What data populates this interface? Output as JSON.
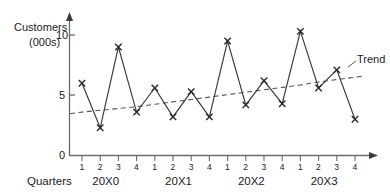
{
  "chart_data": {
    "type": "line",
    "title": "",
    "ylabel": "Customers (000s)",
    "xlabel": "Quarters",
    "ylim": [
      0,
      11
    ],
    "yticks": [
      0,
      5,
      10
    ],
    "ytick_labels": [
      "0",
      "5",
      "10"
    ],
    "grid": false,
    "legend_position": "inline-right",
    "categories": [
      "1",
      "2",
      "3",
      "4",
      "1",
      "2",
      "3",
      "4",
      "1",
      "2",
      "3",
      "4",
      "1",
      "2",
      "3",
      "4"
    ],
    "year_groups": [
      "20X0",
      "20X1",
      "20X2",
      "20X3"
    ],
    "series": [
      {
        "name": "Customers",
        "marker": "x",
        "values": [
          6.0,
          2.3,
          9.0,
          3.6,
          5.6,
          3.2,
          5.3,
          3.2,
          9.5,
          4.2,
          6.2,
          4.3,
          10.3,
          5.6,
          7.1,
          3.0
        ]
      },
      {
        "name": "Trend",
        "style": "dashed",
        "values": [
          3.6,
          3.75,
          3.9,
          4.05,
          4.25,
          4.45,
          4.65,
          4.85,
          5.05,
          5.25,
          5.45,
          5.65,
          5.85,
          6.1,
          6.3,
          6.5
        ]
      }
    ],
    "annotations": [
      {
        "name": "trend-label",
        "text": "Trend"
      }
    ]
  },
  "axes": {
    "y_axis_title_line1": "Customers",
    "y_axis_title_line2": "(000s)",
    "y_tick_10": "10",
    "y_tick_5": "5",
    "y_tick_0": "0",
    "x_axis_title": "Quarters"
  },
  "x_tick_labels": [
    "1",
    "2",
    "3",
    "4",
    "1",
    "2",
    "3",
    "4",
    "1",
    "2",
    "3",
    "4",
    "1",
    "2",
    "3",
    "4"
  ],
  "year_labels": [
    "20X0",
    "20X1",
    "20X2",
    "20X3"
  ],
  "legend": {
    "trend_label": "Trend"
  },
  "colors": {
    "line": "#3a3a3a",
    "axis": "#6b6b6b",
    "text": "#1a1a1a",
    "trend": "#555555",
    "background": "#ffffff"
  }
}
